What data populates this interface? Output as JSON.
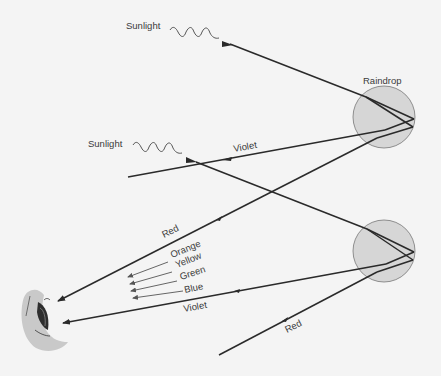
{
  "diagram": {
    "type": "rainbow-formation",
    "labels": {
      "sunlight_top": "Sunlight",
      "sunlight_mid": "Sunlight",
      "raindrop": "Raindrop",
      "violet_upper": "Violet",
      "red_upper": "Red",
      "orange": "Orange",
      "yellow": "Yellow",
      "green": "Green",
      "blue": "Blue",
      "violet_lower": "Violet",
      "red_lower": "Red"
    },
    "colors": {
      "background": "#f4f4f4",
      "raindrop_fill": "#d6d6d6",
      "eye_skin": "#c9c9c9",
      "ray": "#2a2a2a"
    },
    "elements": [
      "sunlight-ray-top",
      "sunlight-ray-mid",
      "raindrop-upper",
      "raindrop-lower",
      "observer-eye"
    ]
  }
}
